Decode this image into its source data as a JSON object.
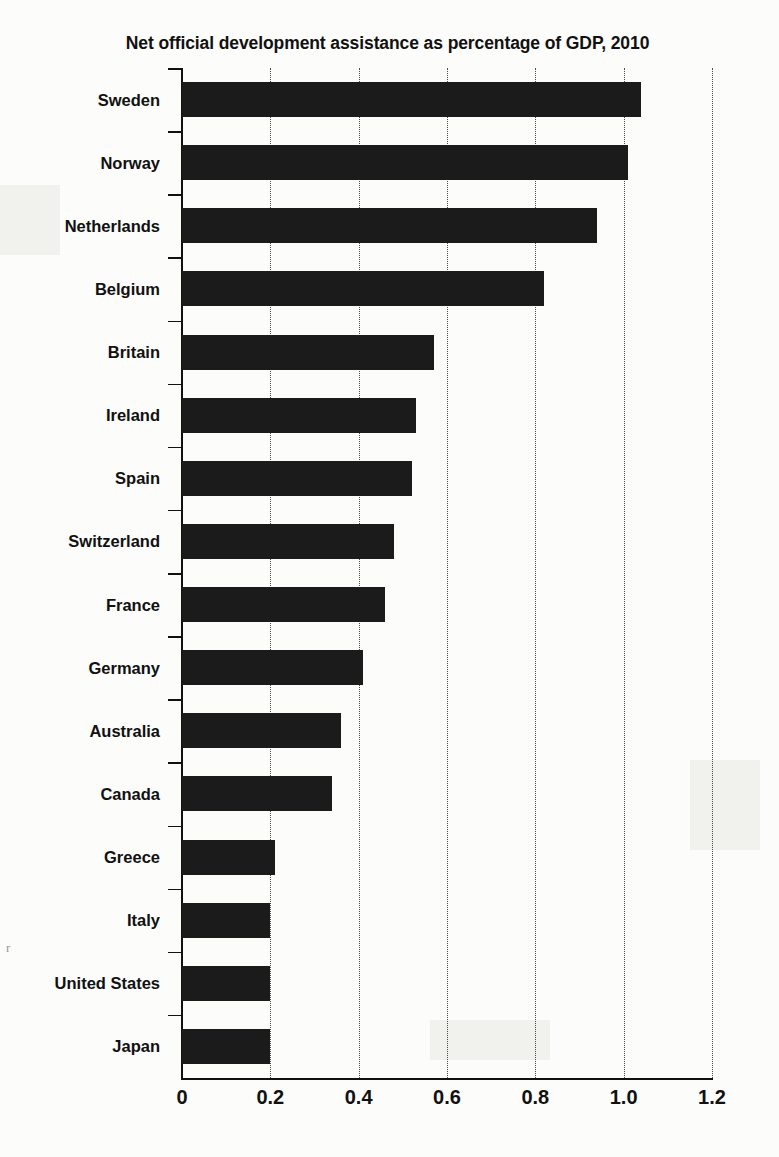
{
  "chart_data": {
    "type": "bar",
    "orientation": "horizontal",
    "title": "Net official development assistance as percentage of GDP, 2010",
    "xlabel": "",
    "ylabel": "",
    "xlim": [
      0,
      1.2
    ],
    "xticks": [
      "0",
      "0.2",
      "0.4",
      "0.6",
      "0.8",
      "1.0",
      "1.2"
    ],
    "xtick_values": [
      0,
      0.2,
      0.4,
      0.6,
      0.8,
      1.0,
      1.2
    ],
    "grid": "vertical-dotted",
    "legend": "none",
    "bar_color": "#1b1b1b",
    "categories": [
      "Sweden",
      "Norway",
      "Netherlands",
      "Belgium",
      "Britain",
      "Ireland",
      "Spain",
      "Switzerland",
      "France",
      "Germany",
      "Australia",
      "Canada",
      "Greece",
      "Italy",
      "United States",
      "Japan"
    ],
    "values": [
      1.04,
      1.01,
      0.94,
      0.82,
      0.57,
      0.53,
      0.52,
      0.48,
      0.46,
      0.41,
      0.36,
      0.34,
      0.21,
      0.2,
      0.2,
      0.2
    ]
  }
}
